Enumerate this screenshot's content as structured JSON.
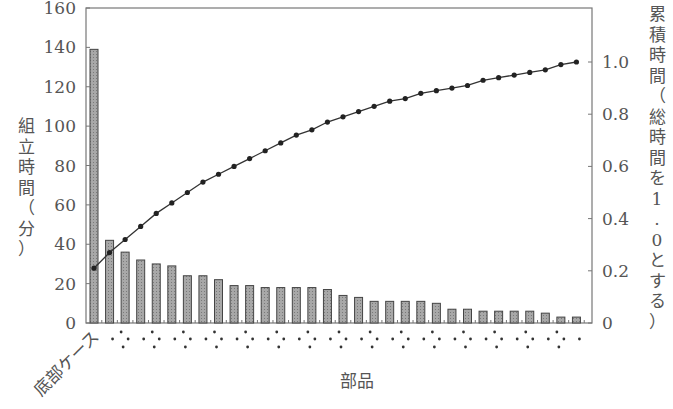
{
  "chart_data": {
    "type": "bar",
    "subtype": "pareto (bar + cumulative line)",
    "title": "",
    "xlabel": "部品",
    "ylabel": "組立時間（分）",
    "y2label": "累積時間（総時間を1.0とする）",
    "first_category_label": "底部ケース",
    "other_category_labels": "obscured (dotted placeholders)",
    "ylim": [
      0,
      160
    ],
    "yticks": [
      0,
      20,
      40,
      60,
      80,
      100,
      120,
      140,
      160
    ],
    "y2lim": [
      0,
      1.0
    ],
    "y2ticks": [
      0,
      0.2,
      0.4,
      0.6,
      0.8,
      1.0
    ],
    "grid": false,
    "legend": "none",
    "categories": [
      "底部ケース",
      "2",
      "3",
      "4",
      "5",
      "6",
      "7",
      "8",
      "9",
      "10",
      "11",
      "12",
      "13",
      "14",
      "15",
      "16",
      "17",
      "18",
      "19",
      "20",
      "21",
      "22",
      "23",
      "24",
      "25",
      "26",
      "27",
      "28",
      "29",
      "30",
      "31",
      "32"
    ],
    "series": [
      {
        "name": "組立時間（分）",
        "type": "bar",
        "axis": "left",
        "values": [
          139,
          42,
          36,
          32,
          30,
          29,
          24,
          24,
          22,
          19,
          19,
          18,
          18,
          18,
          18,
          17,
          14,
          13,
          11,
          11,
          11,
          11,
          10,
          7,
          7,
          6,
          6,
          6,
          6,
          5,
          3,
          3
        ]
      },
      {
        "name": "累積時間",
        "type": "line",
        "axis": "right",
        "values": [
          0.21,
          0.27,
          0.32,
          0.37,
          0.42,
          0.46,
          0.5,
          0.54,
          0.57,
          0.6,
          0.63,
          0.66,
          0.69,
          0.72,
          0.74,
          0.77,
          0.79,
          0.81,
          0.83,
          0.85,
          0.86,
          0.88,
          0.89,
          0.9,
          0.91,
          0.93,
          0.94,
          0.95,
          0.96,
          0.97,
          0.99,
          1.0
        ]
      }
    ]
  },
  "colors": {
    "bar_fill": "#9a9a9a",
    "bar_stroke": "#444444",
    "line": "#333333",
    "axis": "#777777",
    "text": "#555555"
  }
}
